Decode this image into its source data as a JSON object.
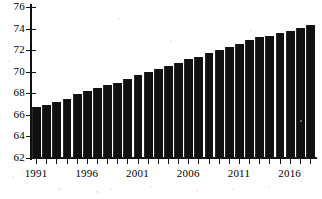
{
  "chart_data": {
    "type": "bar",
    "title": "",
    "subtitle": "",
    "xlabel": "",
    "ylabel": "",
    "ylim": [
      62,
      76
    ],
    "ytick_step": 2,
    "yticks": [
      62,
      64,
      66,
      68,
      70,
      72,
      74,
      76
    ],
    "grid": false,
    "legend": false,
    "bar_color": "#111111",
    "background_color": "#ffffff",
    "axis_color": "#111111",
    "categories": [
      "1991",
      "1992",
      "1993",
      "1994",
      "1995",
      "1996",
      "1997",
      "1998",
      "1999",
      "2000",
      "2001",
      "2002",
      "2003",
      "2004",
      "2005",
      "2006",
      "2007",
      "2008",
      "2009",
      "2010",
      "2011",
      "2012",
      "2013",
      "2014",
      "2015",
      "2016",
      "2017",
      "2018"
    ],
    "values": [
      66.7,
      66.9,
      67.2,
      67.5,
      67.9,
      68.2,
      68.45,
      68.75,
      69.0,
      69.3,
      69.65,
      70.0,
      70.25,
      70.5,
      70.85,
      71.15,
      71.4,
      71.75,
      72.05,
      72.25,
      72.6,
      72.9,
      73.2,
      73.35,
      73.55,
      73.8,
      74.05,
      74.35
    ],
    "xtick_labels": [
      "1991",
      "1996",
      "2001",
      "2006",
      "2011",
      "2016"
    ],
    "xtick_label_indices": [
      0,
      5,
      10,
      15,
      20,
      25
    ],
    "last_bar_value": 74.7,
    "first_bar_value": 66.7,
    "n_bars": 28
  }
}
